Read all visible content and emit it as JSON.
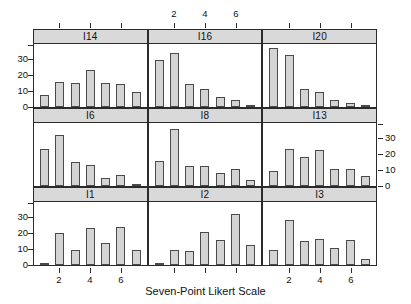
{
  "figure": {
    "xlabel": "Seven-Point Likert Scale",
    "bar_fill": "#d4d4d4",
    "bar_stroke": "#4a4a4a",
    "strip_fill": "#d9d9d9",
    "frame_color": "#2b2b2b"
  },
  "axes": {
    "y_ticks": [
      "0",
      "10",
      "20",
      "30"
    ],
    "x_ticks": [
      "2",
      "4",
      "6"
    ],
    "ylim": [
      0,
      39
    ],
    "xlim": [
      0.5,
      7.5
    ]
  },
  "chart_data": {
    "type": "bar",
    "title": "",
    "subtitle": "",
    "xlabel": "Seven-Point Likert Scale",
    "ylabel": "",
    "xlim": [
      0.5,
      7.5
    ],
    "ylim": [
      0,
      39
    ],
    "grid": false,
    "legend": "none",
    "layout": "3x3 trellis of histograms",
    "categories": [
      "1",
      "2",
      "3",
      "4",
      "5",
      "6",
      "7"
    ],
    "x_tick_labels": [
      "2",
      "4",
      "6"
    ],
    "y_tick_labels": [
      "0",
      "10",
      "20",
      "30"
    ],
    "panels": [
      {
        "name": "I14",
        "row": 0,
        "col": 0,
        "values": [
          7.5,
          15.5,
          15.3,
          23.5,
          15.0,
          14.3,
          9.5
        ]
      },
      {
        "name": "I16",
        "row": 0,
        "col": 1,
        "values": [
          29.5,
          34.0,
          14.5,
          11.3,
          6.5,
          4.2,
          0.6
        ]
      },
      {
        "name": "I20",
        "row": 0,
        "col": 2,
        "values": [
          37.0,
          32.5,
          11.5,
          9.7,
          4.5,
          2.8,
          1.2
        ]
      },
      {
        "name": "I6",
        "row": 1,
        "col": 0,
        "values": [
          23.0,
          32.0,
          15.0,
          13.0,
          5.0,
          7.0,
          1.5
        ]
      },
      {
        "name": "I8",
        "row": 1,
        "col": 1,
        "values": [
          16.0,
          36.0,
          12.5,
          12.5,
          8.0,
          11.0,
          3.5
        ]
      },
      {
        "name": "I13",
        "row": 1,
        "col": 2,
        "values": [
          9.5,
          23.0,
          18.0,
          22.5,
          11.0,
          11.0,
          6.0
        ]
      },
      {
        "name": "I1",
        "row": 2,
        "col": 0,
        "values": [
          0.8,
          20.0,
          9.7,
          23.0,
          14.0,
          24.0,
          9.3
        ]
      },
      {
        "name": "I2",
        "row": 2,
        "col": 1,
        "values": [
          0.8,
          9.7,
          9.0,
          20.5,
          16.0,
          32.0,
          12.5
        ]
      },
      {
        "name": "I3",
        "row": 2,
        "col": 2,
        "values": [
          9.7,
          28.5,
          15.0,
          16.5,
          11.0,
          16.0,
          3.5
        ]
      }
    ]
  }
}
